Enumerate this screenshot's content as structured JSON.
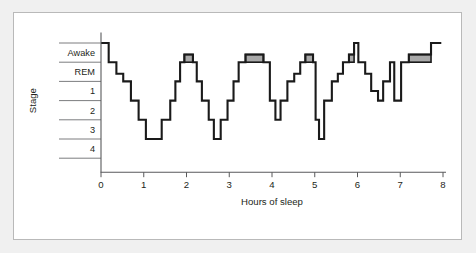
{
  "chart_data": {
    "type": "line",
    "title": "",
    "subtitle": "",
    "xlabel": "Hours of sleep",
    "ylabel": "Stage",
    "grid": true,
    "legend_position": "none",
    "xlim": [
      0,
      8
    ],
    "xticks": [
      "0",
      "1",
      "2",
      "3",
      "4",
      "5",
      "6",
      "7",
      "8"
    ],
    "xtick_values": [
      0,
      1,
      2,
      3,
      4,
      5,
      6,
      7,
      8
    ],
    "ylabels": [
      "Awake",
      "REM",
      "1",
      "2",
      "3",
      "4"
    ],
    "ytick_levels": [
      0,
      1,
      2,
      3,
      4,
      5
    ],
    "ylim_levels": [
      6,
      0
    ],
    "annotations": "Shaded gray boxes mark REM sleep episodes",
    "colors": {
      "trace": "#1a1a1a",
      "rem_fill": "#a9a9a9",
      "axis": "#58595b",
      "panel": "#ffffff",
      "page": "#f0f0f0",
      "border": "#b9b9b9"
    },
    "series": [
      {
        "name": "Sleep stage",
        "step_points": [
          [
            0.0,
            0.0
          ],
          [
            0.18,
            0.0
          ],
          [
            0.18,
            1.0
          ],
          [
            0.36,
            1.0
          ],
          [
            0.36,
            1.6
          ],
          [
            0.52,
            1.6
          ],
          [
            0.52,
            2.0
          ],
          [
            0.7,
            2.0
          ],
          [
            0.7,
            3.0
          ],
          [
            0.88,
            3.0
          ],
          [
            0.88,
            4.0
          ],
          [
            1.05,
            4.0
          ],
          [
            1.05,
            5.0
          ],
          [
            1.42,
            5.0
          ],
          [
            1.42,
            4.0
          ],
          [
            1.62,
            4.0
          ],
          [
            1.62,
            3.0
          ],
          [
            1.74,
            3.0
          ],
          [
            1.74,
            2.0
          ],
          [
            1.85,
            2.0
          ],
          [
            1.85,
            1.0
          ],
          [
            1.95,
            1.0
          ],
          [
            1.95,
            0.6
          ],
          [
            2.15,
            0.6
          ],
          [
            2.15,
            1.0
          ],
          [
            2.24,
            1.0
          ],
          [
            2.24,
            2.0
          ],
          [
            2.36,
            2.0
          ],
          [
            2.36,
            3.0
          ],
          [
            2.52,
            3.0
          ],
          [
            2.52,
            4.0
          ],
          [
            2.64,
            4.0
          ],
          [
            2.64,
            5.0
          ],
          [
            2.8,
            5.0
          ],
          [
            2.8,
            4.0
          ],
          [
            2.96,
            4.0
          ],
          [
            2.96,
            3.0
          ],
          [
            3.1,
            3.0
          ],
          [
            3.1,
            2.0
          ],
          [
            3.22,
            2.0
          ],
          [
            3.22,
            1.0
          ],
          [
            3.38,
            1.0
          ],
          [
            3.38,
            0.6
          ],
          [
            3.8,
            0.6
          ],
          [
            3.8,
            1.0
          ],
          [
            3.95,
            1.0
          ],
          [
            3.95,
            3.0
          ],
          [
            4.08,
            3.0
          ],
          [
            4.08,
            4.0
          ],
          [
            4.2,
            4.0
          ],
          [
            4.2,
            3.0
          ],
          [
            4.36,
            3.0
          ],
          [
            4.36,
            2.0
          ],
          [
            4.52,
            2.0
          ],
          [
            4.52,
            1.6
          ],
          [
            4.66,
            1.6
          ],
          [
            4.66,
            1.0
          ],
          [
            4.78,
            1.0
          ],
          [
            4.78,
            0.6
          ],
          [
            4.96,
            0.6
          ],
          [
            4.96,
            1.0
          ],
          [
            5.02,
            1.0
          ],
          [
            5.02,
            4.0
          ],
          [
            5.1,
            4.0
          ],
          [
            5.1,
            5.0
          ],
          [
            5.22,
            5.0
          ],
          [
            5.22,
            3.0
          ],
          [
            5.4,
            3.0
          ],
          [
            5.4,
            2.0
          ],
          [
            5.54,
            2.0
          ],
          [
            5.54,
            1.6
          ],
          [
            5.66,
            1.6
          ],
          [
            5.66,
            1.0
          ],
          [
            5.8,
            1.0
          ],
          [
            5.8,
            0.6
          ],
          [
            5.92,
            0.6
          ],
          [
            5.92,
            0.0
          ],
          [
            6.02,
            0.0
          ],
          [
            6.02,
            1.0
          ],
          [
            6.18,
            1.0
          ],
          [
            6.18,
            1.6
          ],
          [
            6.32,
            1.6
          ],
          [
            6.32,
            2.5
          ],
          [
            6.48,
            2.5
          ],
          [
            6.48,
            3.0
          ],
          [
            6.6,
            3.0
          ],
          [
            6.6,
            2.0
          ],
          [
            6.76,
            2.0
          ],
          [
            6.76,
            1.0
          ],
          [
            6.86,
            1.0
          ],
          [
            6.86,
            3.0
          ],
          [
            7.02,
            3.0
          ],
          [
            7.02,
            1.0
          ],
          [
            7.2,
            1.0
          ],
          [
            7.2,
            0.6
          ],
          [
            7.72,
            0.6
          ],
          [
            7.72,
            0.0
          ],
          [
            7.96,
            0.0
          ]
        ],
        "rem_episodes": [
          {
            "start": 1.95,
            "end": 2.15,
            "top_level": 0.6,
            "base_level": 1.0
          },
          {
            "start": 3.38,
            "end": 3.8,
            "top_level": 0.6,
            "base_level": 1.0
          },
          {
            "start": 4.78,
            "end": 4.96,
            "top_level": 0.6,
            "base_level": 1.0
          },
          {
            "start": 5.8,
            "end": 5.92,
            "top_level": 0.6,
            "base_level": 1.0
          },
          {
            "start": 7.2,
            "end": 7.72,
            "top_level": 0.6,
            "base_level": 1.0
          }
        ]
      }
    ]
  }
}
